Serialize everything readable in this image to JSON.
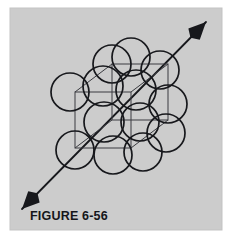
{
  "figure": {
    "caption": "FIGURE 6-56",
    "canvas": {
      "width": 235,
      "height": 243,
      "background": "#ffffff"
    },
    "panel": {
      "x": 10,
      "y": 8,
      "width": 212,
      "height": 222,
      "fill": "#cccccc",
      "border_color": "#c3c3c3"
    },
    "colors": {
      "line": "#17181c",
      "sphere_stroke": "#17181c",
      "cube_stroke": "#3a3b40",
      "panel_fill": "#cccccc",
      "page_background": "#ffffff",
      "caption": "#15161a"
    },
    "caption_position": {
      "x": 30,
      "y": 220
    },
    "cube": {
      "stroke_width": 1.0,
      "front_square": {
        "x": 75,
        "y": 92,
        "size": 56
      },
      "depth_offset": {
        "dx": 37,
        "dy": -28
      },
      "vertices_front": [
        [
          75,
          92
        ],
        [
          131,
          92
        ],
        [
          131,
          148
        ],
        [
          75,
          148
        ]
      ],
      "vertices_back": [
        [
          112,
          64
        ],
        [
          168,
          64
        ],
        [
          168,
          120
        ],
        [
          112,
          120
        ]
      ]
    },
    "arrow": {
      "label": "body-diagonal-direction",
      "start": {
        "x": 22,
        "y": 209
      },
      "end": {
        "x": 206,
        "y": 22
      },
      "stroke_width": 1.8,
      "head_length": 17,
      "head_half_width": 8,
      "double_headed": true
    },
    "spheres": {
      "stroke_width": 1.7,
      "fill": "none",
      "radius_default": 19,
      "items": [
        {
          "name": "sphere-corner-back-top-left",
          "cx": 112,
          "cy": 64,
          "r": 19
        },
        {
          "name": "sphere-face-back-top",
          "cx": 131,
          "cy": 57,
          "r": 19
        },
        {
          "name": "sphere-corner-back-top-right",
          "cx": 160,
          "cy": 70,
          "r": 19
        },
        {
          "name": "sphere-corner-front-top-left",
          "cx": 70,
          "cy": 92,
          "r": 19
        },
        {
          "name": "sphere-face-top-center",
          "cx": 103,
          "cy": 86,
          "r": 20
        },
        {
          "name": "sphere-face-center-right",
          "cx": 136,
          "cy": 90,
          "r": 20
        },
        {
          "name": "sphere-face-back-right",
          "cx": 168,
          "cy": 104,
          "r": 19
        },
        {
          "name": "sphere-body-center",
          "cx": 104,
          "cy": 122,
          "r": 20
        },
        {
          "name": "sphere-face-center-left",
          "cx": 140,
          "cy": 122,
          "r": 19
        },
        {
          "name": "sphere-face-right-lower",
          "cx": 166,
          "cy": 133,
          "r": 19
        },
        {
          "name": "sphere-corner-front-bottom-left",
          "cx": 75,
          "cy": 150,
          "r": 19
        },
        {
          "name": "sphere-face-bottom-center",
          "cx": 113,
          "cy": 155,
          "r": 19
        },
        {
          "name": "sphere-corner-front-bottom-right",
          "cx": 143,
          "cy": 152,
          "r": 19
        }
      ]
    }
  }
}
